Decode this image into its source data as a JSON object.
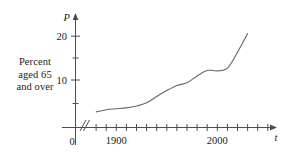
{
  "figure": {
    "caption_lines": [
      "Percent",
      "aged 65",
      "and over"
    ],
    "y_axis_name": "P",
    "x_axis_name": "t",
    "origin_label": "0",
    "y_tick_labels": [
      "10",
      "20"
    ],
    "x_tick_labels": [
      "1900",
      "2000"
    ],
    "curve_color": "#666666",
    "axis_color": "#4d4d4d",
    "text_color": "#1a1a1a",
    "background_color": "#ffffff"
  },
  "chart_data": {
    "type": "line",
    "title": "",
    "subtitle": "",
    "xlabel": "t",
    "ylabel": "P",
    "ylabel_long": "Percent aged 65 and over",
    "grid": false,
    "legend": "none",
    "axis_break_on_x": true,
    "xlim": [
      1860,
      2040
    ],
    "ylim": [
      0,
      24
    ],
    "x_major_ticks": [
      1900,
      2000
    ],
    "x_minor_ticks": [
      1870,
      1880,
      1890,
      1910,
      1920,
      1930,
      1940,
      1950,
      1960,
      1970,
      1980,
      1990,
      2010,
      2020,
      2030
    ],
    "y_ticks": [
      0,
      5,
      10,
      15,
      20
    ],
    "y_tick_labels_shown": [
      10,
      20
    ],
    "series": [
      {
        "name": "Percent aged 65 and over",
        "x": [
          1880,
          1890,
          1900,
          1910,
          1920,
          1930,
          1940,
          1950,
          1960,
          1970,
          1980,
          1990,
          2000,
          2010,
          2020,
          2030
        ],
        "values": [
          3.4,
          3.9,
          4.1,
          4.3,
          4.7,
          5.4,
          6.8,
          8.1,
          9.2,
          9.8,
          11.3,
          12.5,
          12.4,
          13.0,
          16.5,
          20.6
        ]
      }
    ]
  }
}
